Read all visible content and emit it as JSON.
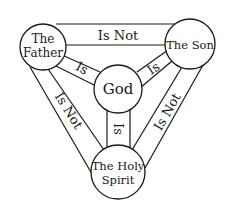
{
  "diagram": {
    "nodes": {
      "father": {
        "line1": "The",
        "line2": "Father"
      },
      "son": {
        "label": "The Son"
      },
      "god": {
        "label": "God"
      },
      "spirit": {
        "line1": "The Holy",
        "line2": "Spirit"
      }
    },
    "edges": {
      "father_son": "Is Not",
      "father_god": "Is",
      "son_god": "Is",
      "god_spirit": "Is",
      "father_spirit": "Is Not",
      "son_spirit": "Is Not"
    },
    "colors": {
      "stroke": "#1a1a1a",
      "background": "#ffffff"
    }
  }
}
